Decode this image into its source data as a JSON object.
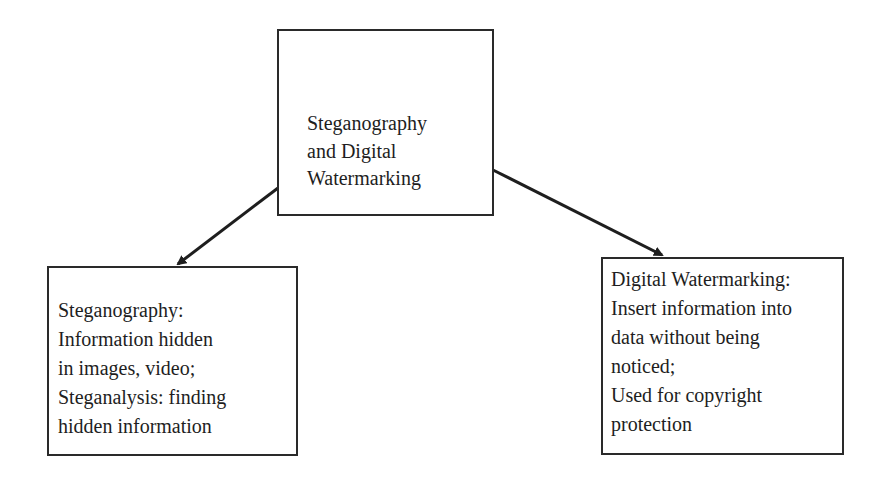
{
  "diagram": {
    "root": {
      "lines": [
        "Steganography",
        "and Digital",
        "Watermarking"
      ]
    },
    "children": [
      {
        "id": "steganography",
        "lines": [
          "Steganography:",
          "Information hidden",
          "in images, video;",
          "Steganalysis: finding",
          "hidden information"
        ]
      },
      {
        "id": "digital-watermarking",
        "lines": [
          "Digital Watermarking:",
          "Insert information into",
          "data without being",
          "noticed;",
          "Used for copyright",
          "protection"
        ]
      }
    ],
    "edges": [
      {
        "from": "root",
        "to": "steganography"
      },
      {
        "from": "root",
        "to": "digital-watermarking"
      }
    ]
  }
}
